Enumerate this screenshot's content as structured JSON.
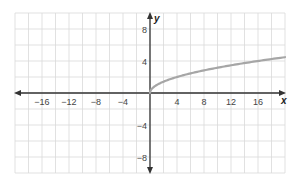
{
  "chart_data": {
    "type": "line",
    "title": "",
    "xlabel": "x",
    "ylabel": "y",
    "xlim": [
      -20,
      20
    ],
    "ylim": [
      -10,
      10
    ],
    "grid": true,
    "grid_step": 2,
    "x_ticks": [
      -16,
      -12,
      -8,
      -4,
      4,
      8,
      12,
      16
    ],
    "x_tick_labels": [
      "−16",
      "−12",
      "−8",
      "−4",
      "4",
      "8",
      "12",
      "16"
    ],
    "y_ticks": [
      8,
      4,
      -4,
      -8
    ],
    "y_tick_labels": [
      "8",
      "4",
      "−4",
      "−8"
    ],
    "series": [
      {
        "name": "y = √x",
        "color": "#a6a6a6",
        "x": [
          0,
          0.25,
          1,
          2,
          4,
          6,
          8,
          10,
          12,
          14,
          16,
          18,
          20
        ],
        "y": [
          0,
          0.5,
          1,
          1.41,
          2,
          2.45,
          2.83,
          3.16,
          3.46,
          3.74,
          4,
          4.24,
          4.47
        ]
      }
    ],
    "legend": null
  },
  "colors": {
    "grid": "#d9d9d9",
    "axis": "#333333",
    "curve": "#a6a6a6"
  }
}
